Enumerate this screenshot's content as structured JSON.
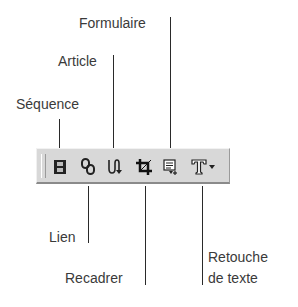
{
  "diagram": {
    "top_labels": [
      {
        "id": "sequence",
        "text": "Séquence"
      },
      {
        "id": "article",
        "text": "Article"
      },
      {
        "id": "formulaire",
        "text": "Formulaire"
      }
    ],
    "bottom_labels": [
      {
        "id": "lien",
        "text": "Lien"
      },
      {
        "id": "recadrer",
        "text": "Recadrer"
      },
      {
        "id": "retouche",
        "text": "Retouche",
        "text2": "de texte"
      }
    ],
    "toolbar": {
      "buttons": [
        {
          "id": "sequence",
          "icon": "film-strip-icon"
        },
        {
          "id": "lien",
          "icon": "chain-link-icon"
        },
        {
          "id": "article",
          "icon": "article-flow-icon"
        },
        {
          "id": "recadrer",
          "icon": "crop-icon"
        },
        {
          "id": "formulaire",
          "icon": "form-icon"
        },
        {
          "id": "retouche",
          "icon": "text-T-icon"
        },
        {
          "id": "dropdown",
          "icon": "dropdown-arrow-icon"
        }
      ]
    }
  }
}
